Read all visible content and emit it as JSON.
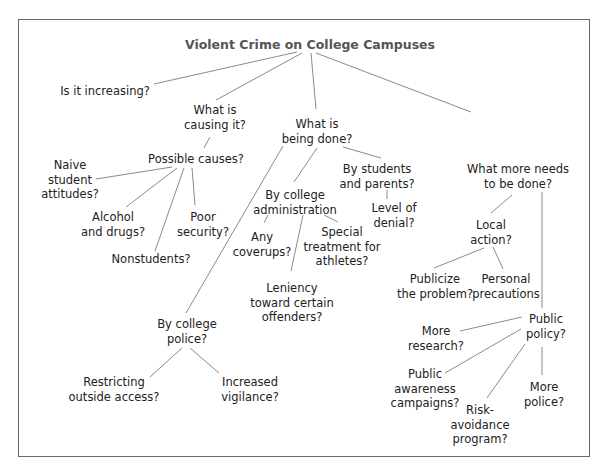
{
  "title": "Violent Crime on College Campuses",
  "nodes": {
    "increasing": "Is it increasing?",
    "causing_1": "What is",
    "causing_2": "causing it?",
    "possible_causes": "Possible causes?",
    "naive_1": "Naive",
    "naive_2": "student",
    "naive_3": "attitudes?",
    "alcohol_1": "Alcohol",
    "alcohol_2": "and drugs?",
    "poor_1": "Poor",
    "poor_2": "security?",
    "nonstudents": "Nonstudents?",
    "being_done_1": "What is",
    "being_done_2": "being done?",
    "by_students_1": "By students",
    "by_students_2": "and parents?",
    "denial_1": "Level of",
    "denial_2": "denial?",
    "by_admin_1": "By college",
    "by_admin_2": "administration",
    "coverups_1": "Any",
    "coverups_2": "coverups?",
    "special_1": "Special",
    "special_2": "treatment for",
    "special_3": "athletes?",
    "leniency_1": "Leniency",
    "leniency_2": "toward certain",
    "leniency_3": "offenders?",
    "by_police_1": "By college",
    "by_police_2": "police?",
    "restricting_1": "Restricting",
    "restricting_2": "outside access?",
    "vigilance_1": "Increased",
    "vigilance_2": "vigilance?",
    "more_needs_1": "What more needs",
    "more_needs_2": "to be done?",
    "local_1": "Local",
    "local_2": "action?",
    "publicize_1": "Publicize",
    "publicize_2": "the problem?",
    "personal_1": "Personal",
    "personal_2": "precautions",
    "public_policy_1": "Public",
    "public_policy_2": "policy?",
    "research_1": "More",
    "research_2": "research?",
    "awareness_1": "Public",
    "awareness_2": "awareness",
    "awareness_3": "campaigns?",
    "risk_1": "Risk-",
    "risk_2": "avoidance",
    "risk_3": "program?",
    "police_more_1": "More",
    "police_more_2": "police?"
  }
}
